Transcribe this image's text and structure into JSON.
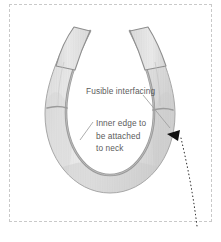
{
  "figure": {
    "type": "sewing-pattern-diagram",
    "background_color": "#ffffff"
  },
  "frame": {
    "style": "dashed",
    "color": "#c9c9c9"
  },
  "annotations": [
    {
      "id": "fusible-interfacing",
      "text": "Fusible interfacing",
      "lines": [
        "Fusible interfacing"
      ],
      "color": "#5c5c5c"
    },
    {
      "id": "inner-edge",
      "text": "Inner edge to be attached to neck",
      "lines": [
        "Inner edge to",
        "be attached",
        "to neck"
      ],
      "color": "#5c5c5c"
    }
  ],
  "colors": {
    "fabric_light": "#ebebeb",
    "fabric_mid": "#dcdcdc",
    "fabric_shadow": "#c2c2c2",
    "edge_outline": "#8f8f8f",
    "inner_edge_dark": "#9a9a9a",
    "arrow_black": "#111111",
    "leader_line": "#9e9e9e",
    "dotted_pointer": "#2b2b2b",
    "text": "#5c5c5c",
    "frame_dash": "#c9c9c9"
  },
  "pointers": {
    "arrowhead": {
      "name": "arrowhead-marker",
      "color": "#111111"
    },
    "dotted_line": {
      "name": "dotted-pointer-line",
      "style": "dotted",
      "color": "#2b2b2b"
    },
    "leader_fusible": {
      "name": "leader-line-fusible",
      "color": "#9e9e9e"
    },
    "leader_inner": {
      "name": "leader-line-inner-edge",
      "color": "#9e9e9e"
    }
  }
}
